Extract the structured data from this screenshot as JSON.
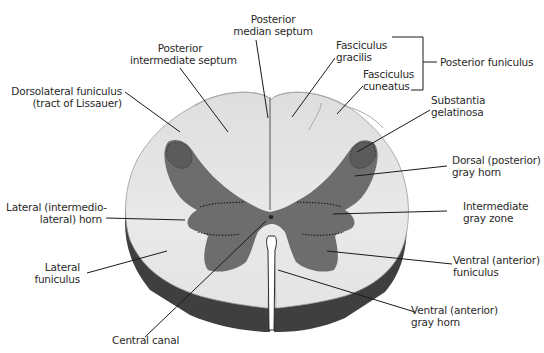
{
  "diagram": {
    "colors": {
      "white_matter": "#e6e6e6",
      "gray_matter": "#6d6d6d",
      "pia_shadow": "#4a4a4a",
      "leader_line": "#1a1a1a",
      "text": "#2a2a2a"
    },
    "labels": {
      "posterior_median_septum": {
        "line1": "Posterior",
        "line2": "median septum"
      },
      "posterior_intermediate_septum": {
        "line1": "Posterior",
        "line2": "intermediate septum"
      },
      "dorsolateral_funiculus": {
        "line1": "Dorsolateral funiculus",
        "line2": "(tract of Lissauer)"
      },
      "fasciculus_gracilis": {
        "line1": "Fasciculus",
        "line2": "gracilis"
      },
      "fasciculus_cuneatus": {
        "line1": "Fasciculus",
        "line2": "cuneatus"
      },
      "posterior_funiculus": {
        "line1": "Posterior funiculus"
      },
      "substantia_gelatinosa": {
        "line1": "Substantia",
        "line2": "gelatinosa"
      },
      "dorsal_gray_horn": {
        "line1": "Dorsal (posterior)",
        "line2": "gray horn"
      },
      "lateral_horn": {
        "line1": "Lateral (intermedio-",
        "line2": "lateral) horn"
      },
      "intermediate_gray_zone": {
        "line1": "Intermediate",
        "line2": "gray zone"
      },
      "lateral_funiculus": {
        "line1": "Lateral",
        "line2": "funiculus"
      },
      "ventral_funiculus": {
        "line1": "Ventral (anterior)",
        "line2": "funiculus"
      },
      "ventral_gray_horn": {
        "line1": "Ventral (anterior)",
        "line2": "gray horn"
      },
      "central_canal": {
        "line1": "Central canal"
      }
    }
  }
}
